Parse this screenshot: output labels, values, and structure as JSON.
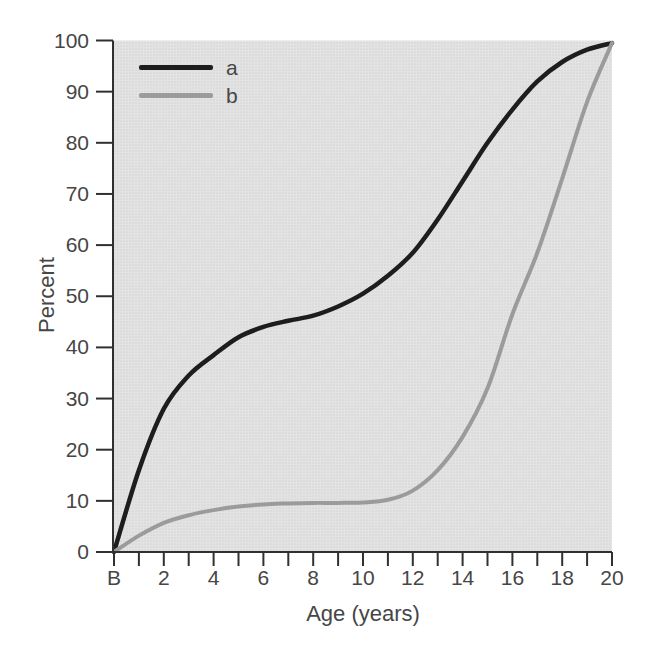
{
  "chart_data": {
    "type": "line",
    "title": "",
    "xlabel": "Age (years)",
    "ylabel": "Percent",
    "x": [
      0,
      1,
      2,
      3,
      4,
      5,
      6,
      7,
      8,
      9,
      10,
      11,
      12,
      13,
      14,
      15,
      16,
      17,
      18,
      19,
      20
    ],
    "xtick_labels": [
      "B",
      "",
      "2",
      "",
      "4",
      "",
      "6",
      "",
      "8",
      "",
      "10",
      "",
      "12",
      "",
      "14",
      "",
      "16",
      "",
      "18",
      "",
      "20"
    ],
    "yticks": [
      0,
      10,
      20,
      30,
      40,
      50,
      60,
      70,
      80,
      90,
      100
    ],
    "ytick_labels": [
      "0",
      "10",
      "20",
      "30",
      "40",
      "50",
      "60",
      "70",
      "80",
      "90",
      "100"
    ],
    "xlim": [
      0,
      20
    ],
    "ylim": [
      0,
      100
    ],
    "grid": false,
    "legend_position": "top-left",
    "series": [
      {
        "name": "a",
        "color": "#1d1d1d",
        "stroke_width": 4.5,
        "values": [
          0,
          16,
          28,
          34.5,
          38.5,
          42,
          44,
          45.2,
          46.2,
          48,
          50.5,
          54,
          58.5,
          65,
          72.5,
          80,
          86.5,
          92,
          95.8,
          98.2,
          99.5
        ]
      },
      {
        "name": "b",
        "color": "#9b9b9b",
        "stroke_width": 4,
        "values": [
          0,
          3.2,
          5.7,
          7.2,
          8.2,
          8.9,
          9.3,
          9.5,
          9.6,
          9.6,
          9.7,
          10.2,
          12,
          16,
          22.5,
          32,
          46.5,
          58.5,
          73,
          88,
          99.5
        ]
      }
    ],
    "colors": {
      "plot_background": "#e3e3e3",
      "stipple_dot": "#c6c6c6",
      "axis": "#303030",
      "text": "#464646",
      "page_background": "#ffffff"
    }
  }
}
